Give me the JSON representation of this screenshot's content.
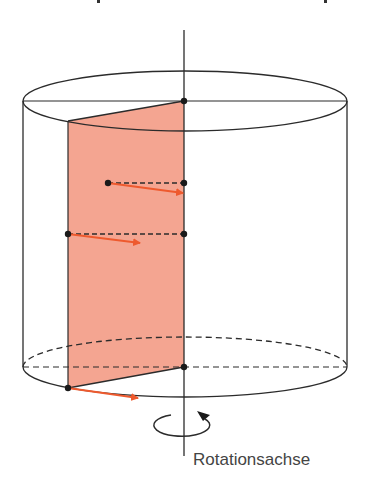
{
  "figure": {
    "label": "Rotationsachse",
    "colors": {
      "stroke": "#2b2b2b",
      "plane_fill": "#f4a591",
      "arrow": "#ee5a2e",
      "text": "#444444"
    },
    "cylinder": {
      "cx": 185,
      "rx": 162,
      "ry": 30,
      "top_cy": 101,
      "bottom_cy": 367
    },
    "axis": {
      "x": 184,
      "y_top": 30,
      "y_bottom": 456
    },
    "plane": {
      "points": [
        [
          68,
          121
        ],
        [
          184,
          101
        ],
        [
          184,
          367
        ],
        [
          68,
          388
        ]
      ]
    },
    "points": [
      {
        "name": "top-axis-point",
        "x": 184,
        "y": 101
      },
      {
        "name": "upper-inner-point",
        "x": 108,
        "y": 183
      },
      {
        "name": "upper-axis-point",
        "x": 184,
        "y": 183
      },
      {
        "name": "middle-edge-point",
        "x": 68,
        "y": 234
      },
      {
        "name": "middle-axis-point",
        "x": 184,
        "y": 234
      },
      {
        "name": "bottom-axis-point",
        "x": 184,
        "y": 367
      },
      {
        "name": "bottom-edge-point",
        "x": 68,
        "y": 388
      }
    ],
    "velocity_arrows": [
      {
        "name": "upper-velocity-arrow",
        "x1": 108,
        "y1": 183,
        "x2": 183,
        "y2": 193
      },
      {
        "name": "middle-velocity-arrow",
        "x1": 68,
        "y1": 234,
        "x2": 140,
        "y2": 243
      },
      {
        "name": "bottom-velocity-arrow",
        "x1": 68,
        "y1": 388,
        "x2": 138,
        "y2": 398
      }
    ]
  }
}
